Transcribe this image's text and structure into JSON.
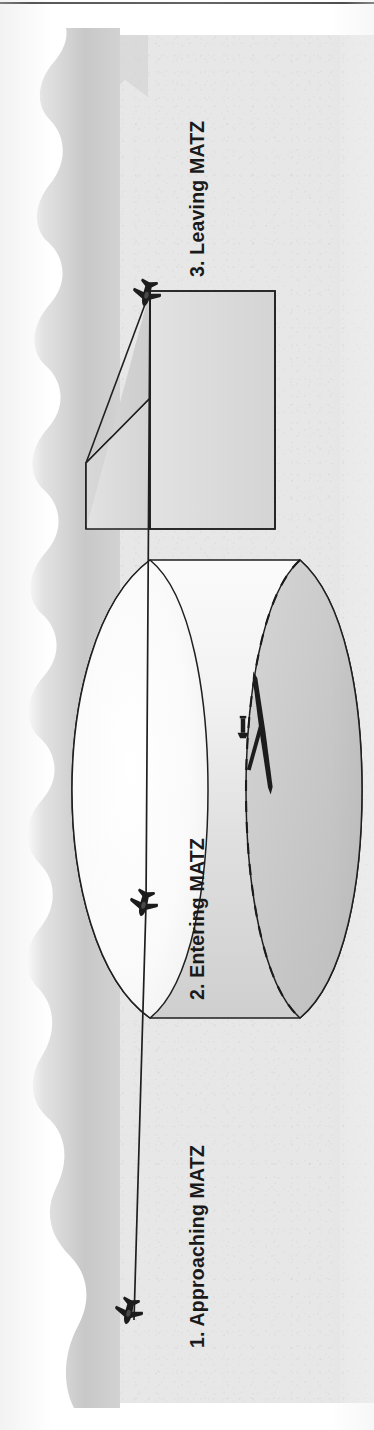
{
  "figure": {
    "orientation": "rotated-90-ccw",
    "captions": [
      {
        "id": "stage-1",
        "text": "1. Approaching MATZ",
        "x": 163,
        "y": 1348
      },
      {
        "id": "stage-2",
        "text": "2. Entering MATZ",
        "x": 163,
        "y": 1000
      },
      {
        "id": "stage-3",
        "text": "3. Leaving MATZ",
        "x": 163,
        "y": 277
      }
    ],
    "elements": {
      "matz_cylinder_label": "MATZ cylinder",
      "matz_stub_label": "MATZ stub",
      "runway_label": "runway",
      "control_tower_label": "control tower",
      "flight_path_label": "aircraft track",
      "aircraft_label": "aircraft"
    },
    "aircraft_positions": [
      {
        "id": "aircraft-approaching",
        "x": 129,
        "y": 1311
      },
      {
        "id": "aircraft-entering",
        "x": 143,
        "y": 905
      },
      {
        "id": "aircraft-leaving",
        "x": 146,
        "y": 295
      }
    ],
    "colors": {
      "ink": "#1a1a1a",
      "paper": "#e7e7e7",
      "cylinder_light": "#f4f4f4",
      "cylinder_dark": "#c9c9c9",
      "stub_fill": "#dcdcdc",
      "gutter_shadow": "#c6c6c6"
    }
  }
}
